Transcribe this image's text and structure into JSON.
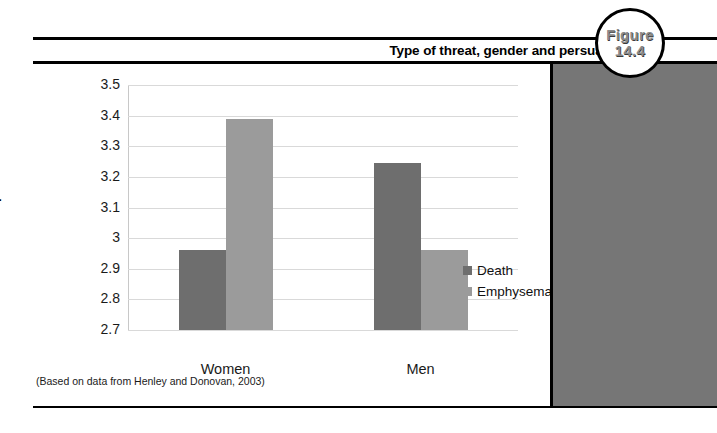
{
  "figure": {
    "title": "Type of threat, gender and persuasion",
    "badge_word": "Figure",
    "badge_number": "14.4",
    "source_note": "(Based on data from Henley and Donovan, 2003)"
  },
  "colors": {
    "death_bar": "#6e6e6e",
    "emphysema_bar": "#9b9b9b",
    "right_panel": "#767676",
    "gridline": "#d9d9d9",
    "rule": "#000000"
  },
  "chart_data": {
    "type": "bar",
    "title": "Type of threat, gender and persuasion",
    "xlabel": "",
    "ylabel": "Mean response",
    "ylim": [
      2.7,
      3.5
    ],
    "ytick_labels": [
      "3.5",
      "3.4",
      "3.3",
      "3.2",
      "3.1",
      "3",
      "2.9",
      "2.8",
      "2.7"
    ],
    "ytick_values": [
      3.5,
      3.4,
      3.3,
      3.2,
      3.1,
      3.0,
      2.9,
      2.8,
      2.7
    ],
    "grid": true,
    "legend_position": "right",
    "categories": [
      "Women",
      "Men"
    ],
    "series": [
      {
        "name": "Death",
        "values": [
          2.96,
          3.245
        ]
      },
      {
        "name": "Emphysema",
        "values": [
          3.39,
          2.96
        ]
      }
    ]
  }
}
